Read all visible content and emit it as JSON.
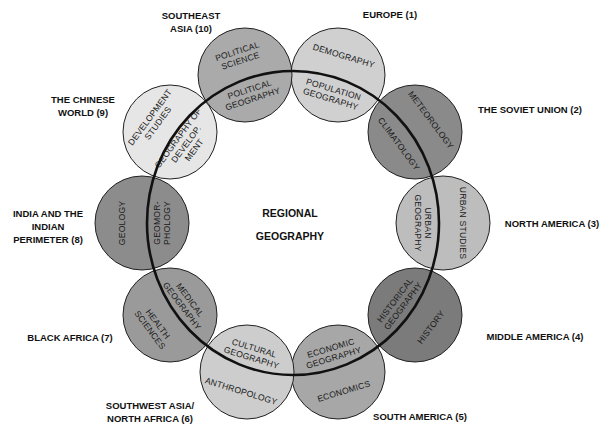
{
  "center": {
    "line1": "REGIONAL",
    "line2": "GEOGRAPHY"
  },
  "ring": {
    "cx": 293,
    "cy": 223,
    "rx": 146,
    "ry": 152
  },
  "nodes": [
    {
      "id": "europe",
      "cx": 338,
      "cy": 75,
      "fill": "#d0d0d0",
      "region": [
        "EUROPE (1)"
      ],
      "region_pos": [
        390,
        18
      ],
      "outer": [
        "DEMOGRAPHY"
      ],
      "inner": [
        "POPULATION",
        "GEOGRAPHY"
      ]
    },
    {
      "id": "soviet",
      "cx": 415,
      "cy": 132,
      "fill": "#8a8a8a",
      "region": [
        "THE SOVIET UNION (2)"
      ],
      "region_pos": [
        530,
        113
      ],
      "outer": [
        "METEOROLOGY"
      ],
      "inner": [
        "CLIMATOLOGY"
      ]
    },
    {
      "id": "north-america",
      "cx": 443,
      "cy": 223,
      "fill": "#bdbdbd",
      "region": [
        "NORTH AMERICA (3)"
      ],
      "region_pos": [
        552,
        227
      ],
      "outer": [
        "URBAN STUDIES"
      ],
      "inner": [
        "URBAN",
        "GEOGRAPHY"
      ]
    },
    {
      "id": "middle-america",
      "cx": 415,
      "cy": 315,
      "fill": "#7b7b7b",
      "region": [
        "MIDDLE AMERICA (4)"
      ],
      "region_pos": [
        535,
        340
      ],
      "outer": [
        "HISTORY"
      ],
      "inner": [
        "HISTORICAL",
        "GEOGRAPHY"
      ]
    },
    {
      "id": "south-america",
      "cx": 338,
      "cy": 372,
      "fill": "#a7a7a7",
      "region": [
        "SOUTH AMERICA (5)"
      ],
      "region_pos": [
        420,
        420
      ],
      "outer": [
        "ECONOMICS"
      ],
      "inner": [
        "ECONOMIC",
        "GEOGRAPHY"
      ]
    },
    {
      "id": "swasia",
      "cx": 247,
      "cy": 372,
      "fill": "#cdcdcd",
      "region": [
        "SOUTHWEST ASIA/",
        "NORTH AFRICA (6)"
      ],
      "region_pos": [
        150,
        409
      ],
      "outer": [
        "ANTHROPOLOGY"
      ],
      "inner": [
        "CULTURAL",
        "GEOGRAPHY"
      ]
    },
    {
      "id": "black-africa",
      "cx": 170,
      "cy": 315,
      "fill": "#9a9a9a",
      "region": [
        "BLACK AFRICA (7)"
      ],
      "region_pos": [
        70,
        341
      ],
      "outer": [
        "HEALTH",
        "SCIENCES"
      ],
      "inner": [
        "MEDICAL",
        "GEOGRAPHY"
      ]
    },
    {
      "id": "india",
      "cx": 142,
      "cy": 223,
      "fill": "#8c8c8c",
      "region": [
        "INDIA AND THE",
        "INDIAN",
        "PERIMETER (8)"
      ],
      "region_pos": [
        48,
        217
      ],
      "outer": [
        "GEOLOGY"
      ],
      "inner": [
        "GEOMOR-",
        "PHOLOGY"
      ]
    },
    {
      "id": "chinese",
      "cx": 170,
      "cy": 132,
      "fill": "#e6e6e6",
      "region": [
        "THE CHINESE",
        "WORLD (9)"
      ],
      "region_pos": [
        83,
        103
      ],
      "outer": [
        "DEVELOPMENT",
        "STUDIES"
      ],
      "inner": [
        "GEOGRAPHY OF",
        "DEVELOP.",
        "MENT"
      ]
    },
    {
      "id": "southeast-asia",
      "cx": 245,
      "cy": 75,
      "fill": "#aaaaaa",
      "region": [
        "SOUTHEAST",
        "ASIA (10)"
      ],
      "region_pos": [
        191,
        19
      ],
      "outer": [
        "POLITICAL",
        "SCIENCE"
      ],
      "inner": [
        "POLITICAL",
        "GEOGRAPHY"
      ]
    }
  ]
}
